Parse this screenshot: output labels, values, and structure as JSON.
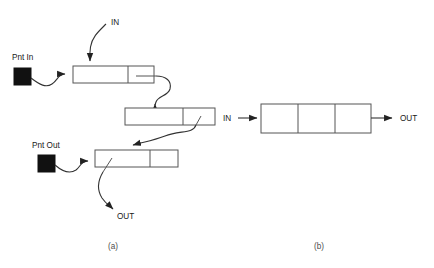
{
  "figure": {
    "title_visible": false,
    "background_color": "#ffffff",
    "line_color": "#333333",
    "box_stroke_color": "#555555",
    "pointer_fill_color": "#111111",
    "text_color": "#1a1a1a",
    "caption_color": "#4d4d4d"
  },
  "panel_a": {
    "caption": "(a)",
    "labels": {
      "in": "IN",
      "out": "OUT",
      "pnt_in": "Pnt In",
      "pnt_out": "Pnt Out"
    },
    "nodes": [
      {
        "name": "node-1",
        "cells": 2,
        "x": 73,
        "y": 66,
        "width": 81,
        "height": 17,
        "divider_x": 128
      },
      {
        "name": "node-2",
        "cells": 2,
        "x": 125,
        "y": 108,
        "width": 90,
        "height": 17,
        "divider_x": 183
      },
      {
        "name": "node-3",
        "cells": 2,
        "x": 95,
        "y": 150,
        "width": 83,
        "height": 17,
        "divider_x": 150
      }
    ],
    "pointers": [
      {
        "name": "pnt-in-square",
        "x": 14,
        "y": 68,
        "size": 17
      },
      {
        "name": "pnt-out-square",
        "x": 38,
        "y": 155,
        "size": 17
      }
    ]
  },
  "panel_b": {
    "caption": "(b)",
    "labels": {
      "in": "IN",
      "out": "OUT"
    },
    "block": {
      "name": "block-3cell",
      "cells": 3,
      "x": 261,
      "y": 104,
      "width": 110,
      "height": 29,
      "divider_x": [
        298,
        335
      ]
    }
  }
}
